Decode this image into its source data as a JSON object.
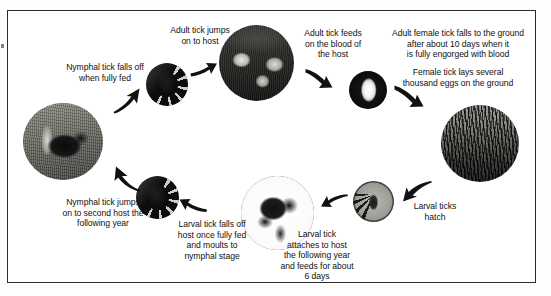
{
  "diagram": {
    "background_color": "#ffffff",
    "frame_color": "#2b2b2b",
    "text_color": "#111111"
  },
  "captions": [
    {
      "id": "nymphal-falls-off",
      "text": "Nymphal tick falls off\nwhen fully fed"
    },
    {
      "id": "adult-jumps",
      "text": "Adult tick jumps\non to host"
    },
    {
      "id": "adult-feeds",
      "text": "Adult tick feeds\non the blood of\nthe host"
    },
    {
      "id": "female-falls",
      "text": "Adult female tick falls to the ground\nafter about 10 days when it\nis fully engorged with blood"
    },
    {
      "id": "female-lays-eggs",
      "text": "Female tick lays several\nthousand eggs on the ground"
    },
    {
      "id": "larval-hatch",
      "text": "Larval ticks\nhatch"
    },
    {
      "id": "larval-attaches",
      "text": "Larval tick\nattaches to host\nthe following year\nand feeds for about\n6 days"
    },
    {
      "id": "larval-falls-off",
      "text": "Larval tick falls off\nhost once fully fed\nand moults to\nnymphal stage"
    },
    {
      "id": "nymphal-jumps",
      "text": "Nymphal tick jumps\non to second host the\nfollowing year"
    }
  ],
  "nodes": [
    {
      "id": "dog-host-photo",
      "label": "dog host photo"
    },
    {
      "id": "adult-tick-photo",
      "label": "adult tick"
    },
    {
      "id": "sheep-host-photo",
      "label": "sheep host photo"
    },
    {
      "id": "engorged-female-tick-photo",
      "label": "engorged female tick"
    },
    {
      "id": "grass-eggs-photo",
      "label": "grass where eggs are laid"
    },
    {
      "id": "larval-tick-photo",
      "label": "larval tick"
    },
    {
      "id": "rodent-host-photo",
      "label": "rodent host photo"
    },
    {
      "id": "nymphal-tick-photo",
      "label": "nymphal tick"
    }
  ],
  "arrows": [
    {
      "id": "arrow-dog-to-adult-tick",
      "from": "dog-host-photo",
      "to": "adult-tick-photo"
    },
    {
      "id": "arrow-adult-tick-to-sheep",
      "from": "adult-tick-photo",
      "to": "sheep-host-photo"
    },
    {
      "id": "arrow-sheep-to-engorged",
      "from": "sheep-host-photo",
      "to": "engorged-female-tick-photo"
    },
    {
      "id": "arrow-engorged-to-grass",
      "from": "engorged-female-tick-photo",
      "to": "grass-eggs-photo"
    },
    {
      "id": "arrow-grass-to-larva",
      "from": "grass-eggs-photo",
      "to": "larval-tick-photo"
    },
    {
      "id": "arrow-larva-to-rodent",
      "from": "larval-tick-photo",
      "to": "rodent-host-photo"
    },
    {
      "id": "arrow-rodent-to-nymph",
      "from": "rodent-host-photo",
      "to": "nymphal-tick-photo"
    },
    {
      "id": "arrow-nymph-to-dog",
      "from": "nymphal-tick-photo",
      "to": "dog-host-photo"
    }
  ]
}
